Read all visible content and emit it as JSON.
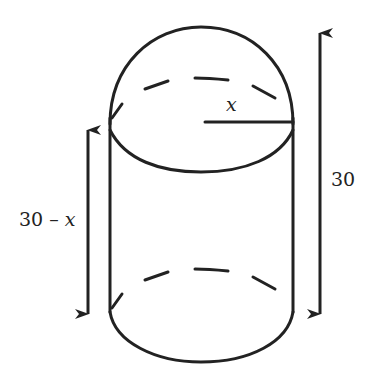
{
  "diagram": {
    "type": "geometry",
    "labels": {
      "radius": "x",
      "cylinder_height_num": "30 – ",
      "cylinder_height_var": "x",
      "total_height": "30"
    },
    "colors": {
      "stroke": "#222222",
      "background": "#ffffff"
    }
  }
}
